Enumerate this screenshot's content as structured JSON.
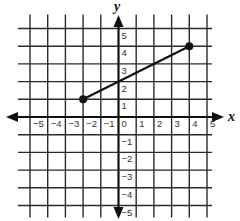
{
  "chart_data": {
    "type": "line",
    "title": "",
    "xlabel": "x",
    "ylabel": "y",
    "xlim": [
      -5,
      5
    ],
    "ylim": [
      -5,
      5
    ],
    "grid": true,
    "x_ticks": [
      -5,
      -4,
      -3,
      -2,
      -1,
      0,
      1,
      2,
      3,
      4,
      5
    ],
    "y_ticks": [
      -5,
      -4,
      -3,
      -2,
      -1,
      1,
      2,
      3,
      4,
      5
    ],
    "x_tick_labels": [
      "−5",
      "−4",
      "−3",
      "−2",
      "−1",
      "0",
      "1",
      "2",
      "3",
      "4",
      "5"
    ],
    "y_tick_labels": [
      "−5",
      "−4",
      "−3",
      "−2",
      "−1",
      "1",
      "2",
      "3",
      "4",
      "5"
    ],
    "series": [
      {
        "name": "line segment",
        "points": [
          {
            "x": -2,
            "y": 1
          },
          {
            "x": 4,
            "y": 4
          }
        ],
        "endpoints_marked": true
      }
    ]
  },
  "colors": {
    "grid": "#2a2a2a",
    "axis": "#111111",
    "segment": "#111111",
    "background": "#ffffff"
  }
}
